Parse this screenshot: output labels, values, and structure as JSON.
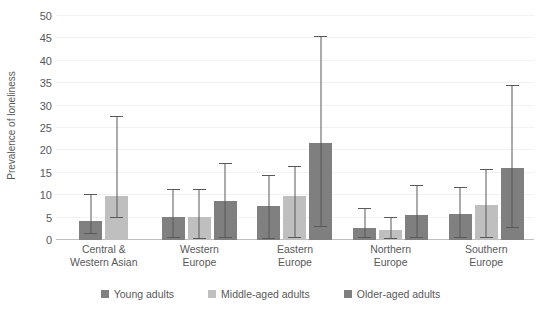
{
  "chart_data": {
    "type": "bar",
    "title": "",
    "xlabel": "",
    "ylabel": "Prevalence of loneliness",
    "ylim": [
      0,
      50
    ],
    "ytick_step": 5,
    "yticks": [
      0,
      5,
      10,
      15,
      20,
      25,
      30,
      35,
      40,
      45,
      50
    ],
    "ytick_labels": [
      "0",
      "5",
      "10",
      "15",
      "20",
      "25",
      "30",
      "35",
      "40",
      "45",
      "50"
    ],
    "grid": true,
    "legend_position": "bottom",
    "error_bars": true,
    "categories": [
      "Central & Western Asian",
      "Western Europe",
      "Eastern Europe",
      "Northern Europe",
      "Southern Europe"
    ],
    "category_lines": [
      [
        "Central &",
        "Western Asian"
      ],
      [
        "Western",
        "Europe"
      ],
      [
        "Eastern",
        "Europe"
      ],
      [
        "Northern",
        "Europe"
      ],
      [
        "Southern",
        "Europe"
      ]
    ],
    "series": [
      {
        "name": "Young adults",
        "color": "#808080",
        "values": [
          4.2,
          5.2,
          7.5,
          2.7,
          5.9
        ],
        "err_low": [
          1.4,
          0.4,
          0.3,
          0.4,
          0.4
        ],
        "err_high": [
          10.2,
          11.4,
          14.6,
          7.1,
          11.8
        ]
      },
      {
        "name": "Middle-aged adults",
        "color": "#bfbfbf",
        "values": [
          9.8,
          5.2,
          9.8,
          2.3,
          7.9
        ],
        "err_low": [
          4.9,
          0.3,
          0.4,
          0.3,
          0.4
        ],
        "err_high": [
          27.6,
          11.4,
          16.5,
          5.1,
          15.8
        ]
      },
      {
        "name": "Older-aged adults",
        "color": "#7f7f7f",
        "values": [
          null,
          8.8,
          21.7,
          5.6,
          16.1
        ],
        "err_low": [
          null,
          0.4,
          2.9,
          0.5,
          2.6
        ],
        "err_high": [
          null,
          17.1,
          45.5,
          12.3,
          34.7
        ]
      }
    ]
  },
  "legend": {
    "items": [
      {
        "label": "Young adults",
        "color": "#808080"
      },
      {
        "label": "Middle-aged adults",
        "color": "#bfbfbf"
      },
      {
        "label": "Older-aged adults",
        "color": "#7f7f7f"
      }
    ]
  }
}
